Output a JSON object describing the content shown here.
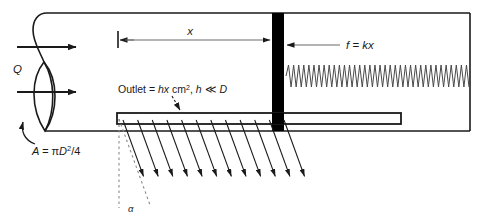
{
  "figure": {
    "background_color": "#ffffff",
    "line_color": "#1a1a1a",
    "piston_color": "#000000",
    "labels": {
      "flow_rate": "Q",
      "area": "A = πD²/4",
      "area_prefix": "A = ",
      "area_pi": "π",
      "area_D": "D",
      "area_exp": "2",
      "area_suffix": "/4",
      "distance": "x",
      "spring_force": "f = kx",
      "spring_force_f": "f",
      "spring_force_eq": " = ",
      "spring_force_k": "k",
      "spring_force_x": "x",
      "outlet_prefix": "Outlet = ",
      "outlet_hx": "hx",
      "outlet_cm": " cm",
      "outlet_exp": "2",
      "outlet_mid": ", ",
      "outlet_h": "h",
      "outlet_ll": " ≪ ",
      "outlet_D": "D",
      "angle": "α"
    },
    "geometry": {
      "pipe_top_y": 13,
      "pipe_bottom_y": 131,
      "pipe_left_x": 36,
      "pipe_right_x": 470,
      "piston_x": 272,
      "piston_width": 12,
      "slot_left_x": 117,
      "slot_right_x": 401,
      "slot_top_y": 113,
      "slot_bottom_y": 124,
      "jet_arrow_count": 12,
      "jet_angle_deg": 20,
      "spring_coil_count": 36,
      "spring_y_center": 76,
      "spring_amplitude": 11,
      "dimension_y": 40,
      "inlet_arrow_count": 2
    }
  }
}
